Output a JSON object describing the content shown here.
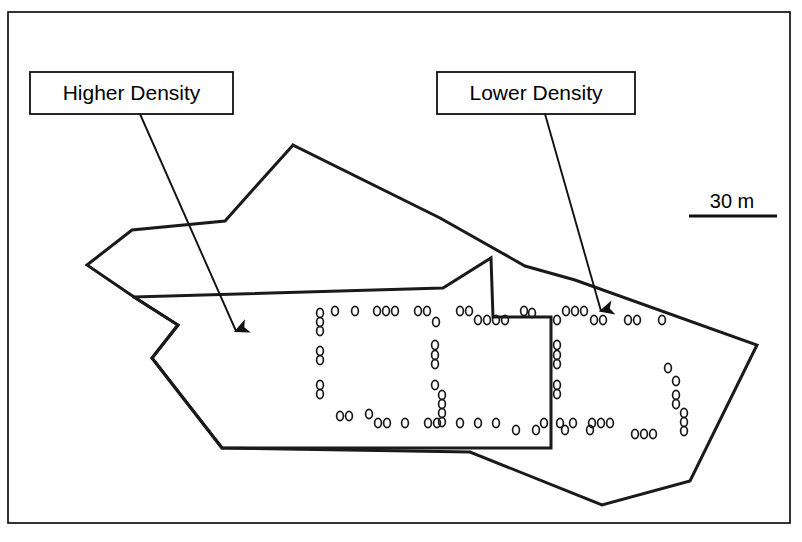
{
  "figure": {
    "frame": {
      "x": 8,
      "y": 12,
      "width": 782,
      "height": 511,
      "stroke": "#000000",
      "stroke_width": 1.6
    },
    "background_color": "#ffffff",
    "line_color": "#1a1a1a"
  },
  "labels": [
    {
      "id": "higher-density",
      "text": "Higher Density",
      "box": {
        "x": 30,
        "y": 72,
        "width": 203,
        "height": 42
      },
      "leader": {
        "x1": 140,
        "y1": 114,
        "x2": 236,
        "y2": 331
      },
      "arrow_tip": {
        "x": 236,
        "y": 331
      }
    },
    {
      "id": "lower-density",
      "text": "Lower Density",
      "box": {
        "x": 437,
        "y": 72,
        "width": 198,
        "height": 42
      },
      "leader": {
        "x1": 545,
        "y1": 114,
        "x2": 601,
        "y2": 311
      },
      "arrow_tip": {
        "x": 601,
        "y": 311
      }
    }
  ],
  "scale_bar": {
    "label": "30 m",
    "text_x": 732,
    "text_y": 208,
    "line_x1": 689,
    "line_y1": 216,
    "line_x2": 777,
    "line_y2": 216,
    "line_width": 3
  },
  "outer_boundary": {
    "name": "site-outer-boundary",
    "stroke_width": 3,
    "points": "293,145 440,218 525,266 575,280 757,345 690,481 602,505 470,452 222,448 152,358 178,325 134,297 87,265 132,230 225,221 293,145"
  },
  "inner_boundary": {
    "name": "higher-density-zone-boundary",
    "stroke_width": 3,
    "points": "134,297 443,288 491,258 493,317 551,317 551,448 222,448 152,358 178,325 134,297"
  },
  "markers": {
    "name": "feature-markers",
    "glyph": "o",
    "radius_x": 3.4,
    "radius_y": 4.6,
    "stroke_width": 1.7,
    "points": [
      [
        320,
        313
      ],
      [
        320,
        322
      ],
      [
        320,
        331
      ],
      [
        320,
        351
      ],
      [
        320,
        360
      ],
      [
        320,
        385
      ],
      [
        320,
        394
      ],
      [
        335,
        311
      ],
      [
        355,
        311
      ],
      [
        377,
        311
      ],
      [
        386,
        311
      ],
      [
        395,
        311
      ],
      [
        418,
        311
      ],
      [
        427,
        311
      ],
      [
        436,
        322
      ],
      [
        460,
        311
      ],
      [
        469,
        311
      ],
      [
        478,
        320
      ],
      [
        487,
        320
      ],
      [
        496,
        320
      ],
      [
        505,
        320
      ],
      [
        435,
        345
      ],
      [
        435,
        355
      ],
      [
        435,
        364
      ],
      [
        435,
        385
      ],
      [
        442,
        395
      ],
      [
        442,
        404
      ],
      [
        442,
        413
      ],
      [
        442,
        422
      ],
      [
        340,
        416
      ],
      [
        349,
        416
      ],
      [
        369,
        414
      ],
      [
        378,
        423
      ],
      [
        387,
        423
      ],
      [
        405,
        423
      ],
      [
        428,
        423
      ],
      [
        437,
        423
      ],
      [
        460,
        423
      ],
      [
        478,
        423
      ],
      [
        496,
        423
      ],
      [
        516,
        430
      ],
      [
        536,
        430
      ],
      [
        544,
        423
      ],
      [
        524,
        311
      ],
      [
        532,
        313
      ],
      [
        557,
        320
      ],
      [
        566,
        311
      ],
      [
        575,
        311
      ],
      [
        584,
        311
      ],
      [
        594,
        320
      ],
      [
        603,
        320
      ],
      [
        628,
        320
      ],
      [
        637,
        320
      ],
      [
        662,
        320
      ],
      [
        557,
        345
      ],
      [
        557,
        355
      ],
      [
        557,
        364
      ],
      [
        557,
        385
      ],
      [
        557,
        394
      ],
      [
        560,
        423
      ],
      [
        565,
        430
      ],
      [
        573,
        423
      ],
      [
        592,
        423
      ],
      [
        601,
        423
      ],
      [
        610,
        423
      ],
      [
        635,
        434
      ],
      [
        644,
        434
      ],
      [
        653,
        434
      ],
      [
        668,
        368
      ],
      [
        676,
        381
      ],
      [
        676,
        395
      ],
      [
        676,
        404
      ],
      [
        684,
        413
      ],
      [
        684,
        422
      ],
      [
        684,
        431
      ],
      [
        590,
        430
      ]
    ]
  }
}
